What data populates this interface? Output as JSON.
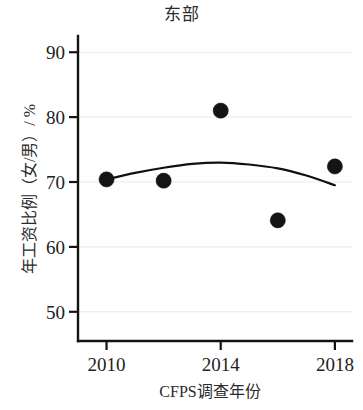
{
  "chart_data": {
    "type": "scatter",
    "title": "东部",
    "xlabel": "CFPS调查年份",
    "ylabel": "年工资比例（女/男）/ %",
    "x": [
      2010,
      2012,
      2014,
      2016,
      2018
    ],
    "values": [
      70.4,
      70.2,
      81.0,
      64.1,
      72.4
    ],
    "series": [
      {
        "name": "年工资比例（女/男）",
        "x": [
          2010,
          2012,
          2014,
          2016,
          2018
        ],
        "values": [
          70.4,
          70.2,
          81.0,
          64.1,
          72.4
        ]
      },
      {
        "name": "二次拟合曲线",
        "type": "line",
        "x": [
          2010,
          2011,
          2012,
          2013,
          2014,
          2015,
          2016,
          2017,
          2018
        ],
        "values": [
          70.4,
          71.4,
          72.2,
          72.8,
          73.0,
          72.7,
          72.1,
          71.0,
          69.5
        ]
      }
    ],
    "xlim": [
      2009.0,
      2018.6
    ],
    "ylim": [
      45.5,
      92.5
    ],
    "xticks": [
      2010,
      2014,
      2018
    ],
    "xtick_labels": [
      "2010",
      "2014",
      "2018"
    ],
    "yticks": [
      50,
      60,
      70,
      80,
      90
    ],
    "ytick_labels": [
      "50",
      "60",
      "70",
      "80",
      "90"
    ],
    "grid": "horizontal",
    "legend": "none",
    "marker": "filled-circle",
    "marker_color": "#141414",
    "line_color": "#111111",
    "grid_color": "#e9e9e9",
    "axis_color": "#141414",
    "background": "#ffffff"
  }
}
